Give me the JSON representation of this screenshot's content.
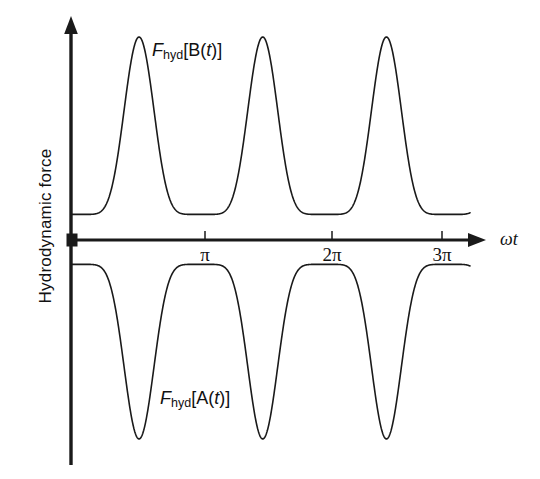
{
  "figure": {
    "background_color": "#ffffff",
    "line_color": "#1a1a1a"
  },
  "axes": {
    "y_axis_label": "Hydrodynamic force",
    "x_axis_label": "ωt",
    "x_axis_label_parts": {
      "omega": "ω",
      "t": "t"
    },
    "origin_marker": "filled-square"
  },
  "labels": {
    "upper_curve": {
      "f": "F",
      "sub": "hyd",
      "bracket_open": "[B(",
      "italic_t": "t",
      "bracket_close": ")]"
    },
    "lower_curve": {
      "f": "F",
      "sub": "hyd",
      "bracket_open": "[A(",
      "italic_t": "t",
      "bracket_close": ")]"
    }
  },
  "chart_data": {
    "type": "line",
    "title": "",
    "xlabel": "ωt",
    "ylabel": "Hydrodynamic force",
    "grid": false,
    "legend": "inline-annotations",
    "xlim": [
      0,
      10.2
    ],
    "ylim": [
      -5.0,
      5.1
    ],
    "x_ticks": [
      3.14159,
      6.28319,
      9.42478
    ],
    "x_tick_labels": [
      "π",
      "2π",
      "3π"
    ],
    "y_ticks": [],
    "y_tick_labels": [],
    "axis_arrows": {
      "x": "right",
      "y": "up"
    },
    "note": "Two sharply peaked periodic curves of period 2π/2 = π in ωt, mirror images about the horizontal axis. Upper curve F_hyd[B(t)] has narrow positive peaks; lower curve F_hyd[A(t)] has narrow negative troughs at the same phases.",
    "series": [
      {
        "name": "F_hyd[B(t)]",
        "sign": "positive",
        "peak_phases_rad": [
          1.728,
          4.87,
          8.012
        ],
        "peak_phases_in_pi": [
          0.55,
          1.55,
          2.55
        ],
        "peak_value": 5.0,
        "trough_value": 0.63,
        "value_at_origin": 0.63,
        "period_rad": 3.14159,
        "shape": "raised-cosine to the 8th power, sharp crest / broad valley"
      },
      {
        "name": "F_hyd[A(t)]",
        "sign": "negative",
        "trough_phases_rad": [
          1.728,
          4.87,
          8.012
        ],
        "trough_phases_in_pi": [
          0.55,
          1.55,
          2.55
        ],
        "trough_value": -4.9,
        "peak_value": -0.6,
        "value_at_origin": -0.57,
        "period_rad": 3.14159,
        "shape": "mirror of upper curve, sharp downward spikes / broad shallow crests near the axis"
      }
    ],
    "sample_points": {
      "x": [
        0.0,
        0.35,
        0.7,
        1.05,
        1.4,
        1.73,
        2.05,
        2.4,
        2.75,
        3.14,
        3.5,
        3.85,
        4.2,
        4.52,
        4.87,
        5.2,
        5.55,
        5.9,
        6.28,
        6.65,
        7.0,
        7.35,
        7.66,
        8.01,
        8.35,
        8.7,
        9.05,
        9.42,
        9.8,
        10.15
      ],
      "B": [
        0.63,
        0.7,
        0.95,
        1.75,
        3.45,
        5.0,
        3.75,
        1.95,
        0.95,
        0.63,
        0.7,
        0.95,
        1.75,
        3.45,
        5.0,
        3.75,
        1.95,
        0.95,
        0.63,
        0.7,
        0.95,
        1.75,
        3.45,
        5.0,
        3.75,
        1.95,
        0.95,
        0.63,
        0.72,
        1.0
      ],
      "A": [
        -0.57,
        -0.64,
        -0.9,
        -1.7,
        -3.4,
        -4.9,
        -3.7,
        -1.9,
        -0.9,
        -0.6,
        -0.66,
        -0.92,
        -1.72,
        -3.42,
        -4.9,
        -3.7,
        -1.9,
        -0.9,
        -0.6,
        -0.66,
        -0.92,
        -1.72,
        -3.42,
        -4.9,
        -3.7,
        -1.9,
        -0.9,
        -0.6,
        -0.7,
        -0.98
      ]
    }
  }
}
